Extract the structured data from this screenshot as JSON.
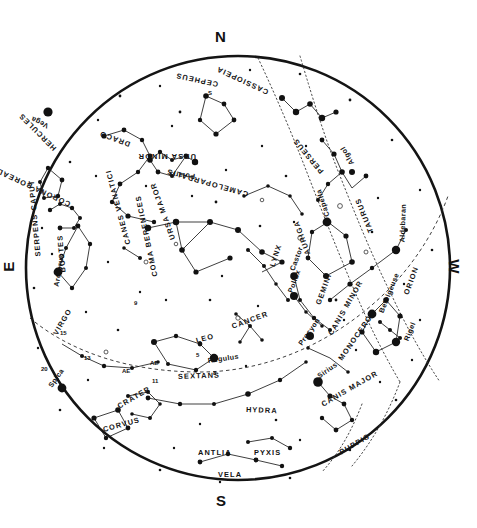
{
  "chart_title": "All-sky star chart",
  "cardinals": {
    "north": "N",
    "south": "S",
    "east": "E",
    "west": "W"
  },
  "chart_data": {
    "type": "scatter",
    "subtitle": "",
    "xlabel": "",
    "ylabel": "",
    "projection": "circular all-sky (zenith-centered)",
    "grid": false,
    "legend": "none",
    "horizon_circle": {
      "cx": 238,
      "cy": 268,
      "r": 212
    },
    "cardinal_points": [
      "N",
      "E",
      "S",
      "W"
    ],
    "constellations": [
      {
        "name": "CEPHEUS",
        "x": 218,
        "y": 80,
        "rot": 192
      },
      {
        "name": "CASSIOPEIA",
        "x": 268,
        "y": 88,
        "rot": 205
      },
      {
        "name": "DRACO",
        "x": 130,
        "y": 140,
        "rot": 200
      },
      {
        "name": "URSA MINOR",
        "x": 196,
        "y": 152,
        "rot": 180
      },
      {
        "name": "HERCULES",
        "x": 55,
        "y": 145,
        "rot": 225
      },
      {
        "name": "CORONA BOREALIS",
        "x": 70,
        "y": 200,
        "rot": 205
      },
      {
        "name": "CAMELOPARDALIS",
        "x": 248,
        "y": 190,
        "rot": 196
      },
      {
        "name": "PERSEUS",
        "x": 322,
        "y": 168,
        "rot": 230
      },
      {
        "name": "AURIGA",
        "x": 308,
        "y": 250,
        "rot": 250
      },
      {
        "name": "TAURUS",
        "x": 371,
        "y": 228,
        "rot": 248
      },
      {
        "name": "URSA MAJOR",
        "x": 173,
        "y": 235,
        "rot": 250
      },
      {
        "name": "CANES VENATICI",
        "x": 128,
        "y": 240,
        "rot": 255
      },
      {
        "name": "COMA BERENICES",
        "x": 155,
        "y": 272,
        "rot": 258
      },
      {
        "name": "SERPENS CAPUT",
        "x": 38,
        "y": 252,
        "rot": 265
      },
      {
        "name": "BOOTES",
        "x": 63,
        "y": 268,
        "rot": 265
      },
      {
        "name": "LYNX",
        "x": 272,
        "y": 262,
        "rot": 288
      },
      {
        "name": "GEMINI",
        "x": 318,
        "y": 300,
        "rot": 290
      },
      {
        "name": "ORION",
        "x": 406,
        "y": 290,
        "rot": 290
      },
      {
        "name": "CANCER",
        "x": 232,
        "y": 322,
        "rot": 340
      },
      {
        "name": "LEO",
        "x": 196,
        "y": 336,
        "rot": 345
      },
      {
        "name": "CANIS MINOR",
        "x": 330,
        "y": 330,
        "rot": 300
      },
      {
        "name": "MONOCEROS",
        "x": 340,
        "y": 355,
        "rot": 305
      },
      {
        "name": "VIRGO",
        "x": 55,
        "y": 330,
        "rot": 300
      },
      {
        "name": "SEXTANS",
        "x": 178,
        "y": 372,
        "rot": 358
      },
      {
        "name": "HYDRA",
        "x": 246,
        "y": 405,
        "rot": 2
      },
      {
        "name": "CRATER",
        "x": 118,
        "y": 402,
        "rot": 330
      },
      {
        "name": "CORVUS",
        "x": 103,
        "y": 425,
        "rot": 345
      },
      {
        "name": "CANIS MAJOR",
        "x": 322,
        "y": 400,
        "rot": 330
      },
      {
        "name": "PUPPIS",
        "x": 340,
        "y": 448,
        "rot": 330
      },
      {
        "name": "ANTLIA",
        "x": 198,
        "y": 448,
        "rot": 0
      },
      {
        "name": "PYXIS",
        "x": 254,
        "y": 448,
        "rot": 0
      },
      {
        "name": "VELA",
        "x": 218,
        "y": 470,
        "rot": 0
      }
    ],
    "named_stars": [
      {
        "name": "Vega",
        "x": 48,
        "y": 122,
        "mag": 0.0,
        "rot": 205
      },
      {
        "name": "Polaris",
        "x": 195,
        "y": 172,
        "mag": 2.0,
        "rot": 185
      },
      {
        "name": "Algol",
        "x": 352,
        "y": 160,
        "mag": 2.1,
        "rot": 240
      },
      {
        "name": "Capella",
        "x": 327,
        "y": 212,
        "mag": 0.1,
        "rot": 252
      },
      {
        "name": "Aldebaran",
        "x": 402,
        "y": 238,
        "mag": 0.9,
        "rot": 272
      },
      {
        "name": "Castor",
        "x": 292,
        "y": 266,
        "mag": 1.6,
        "rot": 290
      },
      {
        "name": "Pollux",
        "x": 290,
        "y": 288,
        "mag": 1.1,
        "rot": 290
      },
      {
        "name": "Betelgeuse",
        "x": 381,
        "y": 308,
        "mag": 0.5,
        "rot": 292
      },
      {
        "name": "Rigel",
        "x": 406,
        "y": 336,
        "mag": 0.1,
        "rot": 292
      },
      {
        "name": "Procyon",
        "x": 300,
        "y": 340,
        "mag": 0.4,
        "rot": 305
      },
      {
        "name": "Sirius",
        "x": 318,
        "y": 372,
        "mag": -1.5,
        "rot": 325
      },
      {
        "name": "Regulus",
        "x": 208,
        "y": 356,
        "mag": 1.4,
        "rot": 352
      },
      {
        "name": "Arcturus",
        "x": 56,
        "y": 282,
        "mag": -0.1,
        "rot": 280
      },
      {
        "name": "Spica",
        "x": 50,
        "y": 382,
        "mag": 1.0,
        "rot": 305
      }
    ],
    "ecliptic_markers": [
      {
        "label": "AE",
        "x": 122,
        "y": 368
      },
      {
        "label": "AE",
        "x": 150,
        "y": 360
      },
      {
        "label": "11",
        "x": 152,
        "y": 378
      },
      {
        "label": "8",
        "x": 213,
        "y": 370
      },
      {
        "label": "5",
        "x": 196,
        "y": 352
      },
      {
        "label": "9",
        "x": 134,
        "y": 300
      },
      {
        "label": "13",
        "x": 84,
        "y": 355
      },
      {
        "label": "15",
        "x": 60,
        "y": 330
      },
      {
        "label": "20",
        "x": 41,
        "y": 366
      },
      {
        "label": "S",
        "x": 208,
        "y": 90
      }
    ]
  }
}
